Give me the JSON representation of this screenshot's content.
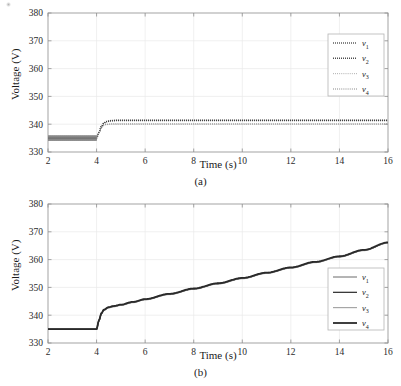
{
  "figure": {
    "background": "#ffffff",
    "speck_artifact": true
  },
  "panels": [
    {
      "id": "a",
      "caption": "(a)",
      "axis": {
        "xlabel": "Time (s)",
        "ylabel": "Voltage (V)",
        "xticks": [
          2,
          4,
          6,
          8,
          10,
          12,
          14,
          16
        ],
        "yticks": [
          330,
          340,
          350,
          360,
          370,
          380
        ],
        "xlim": [
          2,
          16
        ],
        "ylim": [
          330,
          380
        ],
        "grid": true
      },
      "legend": {
        "position": "upper-right",
        "entries": [
          {
            "label": "v",
            "sub": "1",
            "style": "dotted-thick",
            "color": "#4a4a4a"
          },
          {
            "label": "v",
            "sub": "2",
            "style": "dotted-thick",
            "color": "#3a3a3a"
          },
          {
            "label": "v",
            "sub": "3",
            "style": "dotted-thin",
            "color": "#9a9a9a"
          },
          {
            "label": "v",
            "sub": "4",
            "style": "dotted-thin",
            "color": "#6a6a6a"
          }
        ]
      }
    },
    {
      "id": "b",
      "caption": "(b)",
      "axis": {
        "xlabel": "Time (s)",
        "ylabel": "Voltage (V)",
        "xticks": [
          2,
          4,
          6,
          8,
          10,
          12,
          14,
          16
        ],
        "yticks": [
          330,
          340,
          350,
          360,
          370,
          380
        ],
        "xlim": [
          2,
          16
        ],
        "ylim": [
          330,
          380
        ],
        "grid": true
      },
      "legend": {
        "position": "lower-right",
        "entries": [
          {
            "label": "v",
            "sub": "1",
            "style": "solid-thin",
            "color": "#5a5a5a"
          },
          {
            "label": "v",
            "sub": "2",
            "style": "solid-medium",
            "color": "#3a3a3a"
          },
          {
            "label": "v",
            "sub": "3",
            "style": "solid-thin",
            "color": "#8a8a8a"
          },
          {
            "label": "v",
            "sub": "4",
            "style": "solid-thick",
            "color": "#2a2a2a"
          }
        ]
      }
    }
  ],
  "chart_data": [
    {
      "type": "line",
      "panel": "a",
      "title": "",
      "xlabel": "Time (s)",
      "ylabel": "Voltage (V)",
      "xlim": [
        2,
        16
      ],
      "ylim": [
        330,
        380
      ],
      "xticks": [
        2,
        4,
        6,
        8,
        10,
        12,
        14,
        16
      ],
      "yticks": [
        330,
        340,
        350,
        360,
        370,
        380
      ],
      "grid": true,
      "legend": [
        "v1",
        "v2",
        "v3",
        "v4"
      ],
      "legend_position": "upper right",
      "annotations": [
        "(a)"
      ],
      "description": "Four DC bus voltages with ripple near 335 V before t=4 s, stepping up to a steady 340-341.5 V plateau after t=4 s.",
      "x": [
        2.0,
        2.5,
        3.0,
        3.5,
        3.9,
        4.0,
        4.1,
        4.2,
        4.3,
        4.4,
        4.6,
        4.8,
        5.0,
        5.5,
        6.0,
        7.0,
        8.0,
        9.0,
        10.0,
        11.0,
        12.0,
        13.0,
        14.0,
        15.0,
        16.0
      ],
      "series": [
        {
          "name": "v1",
          "values": [
            335.0,
            335.0,
            335.0,
            335.0,
            335.0,
            335.1,
            337.2,
            339.2,
            340.4,
            341.0,
            341.3,
            341.4,
            341.4,
            341.4,
            341.4,
            341.4,
            341.4,
            341.4,
            341.4,
            341.4,
            341.4,
            341.4,
            341.4,
            341.4,
            341.4
          ]
        },
        {
          "name": "v2",
          "values": [
            335.0,
            335.0,
            335.0,
            335.0,
            335.0,
            335.1,
            337.1,
            339.1,
            340.3,
            340.9,
            341.2,
            341.3,
            341.3,
            341.3,
            341.3,
            341.3,
            341.3,
            341.3,
            341.3,
            341.3,
            341.3,
            341.3,
            341.3,
            341.3,
            341.3
          ]
        },
        {
          "name": "v3",
          "values": [
            334.9,
            334.9,
            334.9,
            334.9,
            334.9,
            335.0,
            336.9,
            338.6,
            339.5,
            339.8,
            340.0,
            340.0,
            340.0,
            340.0,
            340.0,
            340.0,
            340.0,
            340.0,
            340.0,
            340.0,
            340.0,
            340.0,
            340.0,
            340.0,
            340.0
          ]
        },
        {
          "name": "v4",
          "values": [
            334.9,
            334.9,
            334.9,
            334.9,
            334.9,
            335.0,
            337.0,
            338.8,
            339.7,
            340.0,
            340.1,
            340.1,
            340.1,
            340.1,
            340.1,
            340.1,
            340.1,
            340.1,
            340.1,
            340.1,
            340.1,
            340.1,
            340.1,
            340.1,
            340.1
          ]
        }
      ],
      "ripple": {
        "start": 2.0,
        "end": 4.0,
        "center": 335.0,
        "amplitude": 0.9,
        "note": "dense high-frequency ripple band"
      }
    },
    {
      "type": "line",
      "panel": "b",
      "title": "",
      "xlabel": "Time (s)",
      "ylabel": "Voltage (V)",
      "xlim": [
        2,
        16
      ],
      "ylim": [
        330,
        380
      ],
      "xticks": [
        2,
        4,
        6,
        8,
        10,
        12,
        14,
        16
      ],
      "yticks": [
        330,
        340,
        350,
        360,
        370,
        380
      ],
      "grid": true,
      "legend": [
        "v1",
        "v2",
        "v3",
        "v4"
      ],
      "legend_position": "lower right",
      "annotations": [
        "(b)"
      ],
      "description": "Four overlapping DC bus voltages flat at 335 V until t=4 s, then a fast rise to about 343 V followed by a linear ramp reaching about 366 V at t=16 s.",
      "x": [
        2.0,
        2.5,
        3.0,
        3.5,
        3.9,
        4.0,
        4.1,
        4.2,
        4.3,
        4.5,
        4.7,
        5.0,
        5.5,
        6.0,
        7.0,
        8.0,
        9.0,
        10.0,
        11.0,
        12.0,
        13.0,
        14.0,
        15.0,
        16.0
      ],
      "series": [
        {
          "name": "v1",
          "values": [
            335.0,
            335.0,
            335.0,
            335.0,
            335.0,
            335.0,
            338.0,
            340.5,
            341.8,
            342.7,
            343.1,
            343.6,
            344.6,
            345.6,
            347.5,
            349.4,
            351.3,
            353.2,
            355.1,
            357.0,
            359.0,
            361.0,
            363.3,
            366.0
          ]
        },
        {
          "name": "v2",
          "values": [
            335.0,
            335.0,
            335.0,
            335.0,
            335.0,
            335.0,
            338.1,
            340.6,
            341.9,
            342.8,
            343.2,
            343.7,
            344.7,
            345.7,
            347.6,
            349.5,
            351.4,
            353.3,
            355.2,
            357.1,
            359.1,
            361.1,
            363.4,
            366.1
          ]
        },
        {
          "name": "v3",
          "values": [
            335.0,
            335.0,
            335.0,
            335.0,
            335.0,
            335.0,
            337.9,
            340.4,
            341.7,
            342.6,
            343.0,
            343.5,
            344.5,
            345.5,
            347.4,
            349.3,
            351.2,
            353.1,
            355.0,
            356.9,
            358.9,
            360.9,
            363.2,
            365.9
          ]
        },
        {
          "name": "v4",
          "values": [
            335.0,
            335.0,
            335.0,
            335.0,
            335.0,
            335.0,
            338.2,
            340.7,
            342.0,
            342.9,
            343.3,
            343.8,
            344.8,
            345.8,
            347.7,
            349.6,
            351.5,
            353.4,
            355.3,
            357.2,
            359.2,
            361.2,
            363.5,
            366.2
          ]
        }
      ]
    }
  ]
}
